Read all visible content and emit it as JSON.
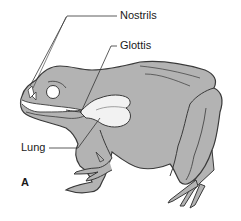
{
  "diagram": {
    "panel_label": "A",
    "labels": [
      {
        "id": "nostrils",
        "text": "Nostrils"
      },
      {
        "id": "glottis",
        "text": "Glottis"
      },
      {
        "id": "lung",
        "text": "Lung"
      }
    ],
    "colors": {
      "body_fill": "#b3b3b3",
      "outline": "#3a3a3a",
      "lung_fill": "#f2f2f2",
      "background": "#ffffff"
    }
  }
}
